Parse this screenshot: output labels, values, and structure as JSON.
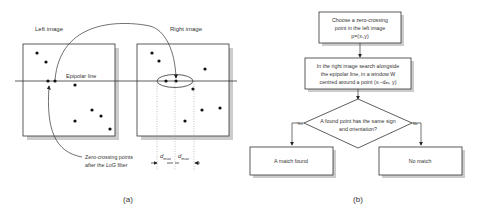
{
  "panel_a": {
    "left_title": "Left image",
    "right_title": "Right image",
    "epipolar_label": "Epipolar line",
    "zero_crossing_label_line1": "Zero-crossing points",
    "zero_crossing_label_line2_pre": "after the ",
    "zero_crossing_label_line2_italic": "LoG",
    "zero_crossing_label_line2_post": " filter",
    "dmax_label": "d",
    "dmax_sub": "max",
    "caption": "(a)"
  },
  "panel_b": {
    "box1_lines": [
      "Choose a zero-crossing",
      "point in the left image",
      "p=(xₗ,y)"
    ],
    "box2_lines": [
      "In the right image search alongside",
      "the epipolar line, in a window W",
      "centred around a point (xₗ−dₐᵥ, y)"
    ],
    "decision_lines": [
      "A found point has the same sign",
      "and orientation?"
    ],
    "yes_label": "Yes",
    "no_label": "No",
    "match_found": "A match found",
    "no_match": "No match",
    "caption": "(b)"
  }
}
